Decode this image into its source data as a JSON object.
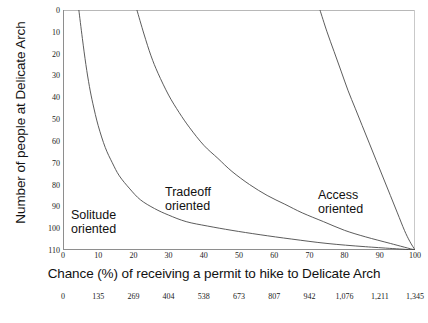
{
  "chart_data": {
    "type": "line",
    "title": "",
    "xlabel": "Chance (%) of receiving a permit to hike to Delicate Arch",
    "ylabel": "Number of people at Delicate Arch",
    "xlim": [
      0,
      100
    ],
    "ylim": [
      0,
      110
    ],
    "y_inverted": true,
    "grid": false,
    "legend_position": "inline-annotations",
    "xticks": [
      "0",
      "10",
      "20",
      "30",
      "40",
      "50",
      "60",
      "70",
      "80",
      "90",
      "100"
    ],
    "xtick_values": [
      0,
      10,
      20,
      30,
      40,
      50,
      60,
      70,
      80,
      90,
      100
    ],
    "yticks": [
      "0",
      "10",
      "20",
      "30",
      "40",
      "50",
      "60",
      "70",
      "80",
      "90",
      "100",
      "110"
    ],
    "ytick_values": [
      0,
      10,
      20,
      30,
      40,
      50,
      60,
      70,
      80,
      90,
      100,
      110
    ],
    "secondary_xaxis": {
      "label": "",
      "ticks": [
        "0",
        "135",
        "269",
        "404",
        "538",
        "673",
        "807",
        "942",
        "1,076",
        "1,211",
        "1,345"
      ],
      "values": [
        0,
        135,
        269,
        404,
        538,
        673,
        807,
        942,
        1076,
        1211,
        1345
      ]
    },
    "series": [
      {
        "name": "Solitude oriented",
        "annotation": "Solitude\noriented",
        "color": "#4a4a4a",
        "x": [
          4.5,
          5.5,
          6.5,
          7.5,
          8.5,
          10,
          12,
          14,
          16,
          19,
          22,
          26,
          30,
          35,
          41,
          48,
          56,
          65,
          75,
          86,
          100
        ],
        "y": [
          0,
          13,
          25,
          35,
          43,
          53,
          63,
          70,
          76,
          82,
          87,
          91,
          94,
          97,
          99,
          101,
          103,
          105,
          107,
          108.5,
          110
        ]
      },
      {
        "name": "Tradeoff oriented",
        "annotation": "Tradeoff\noriented",
        "color": "#4a4a4a",
        "x": [
          21,
          23,
          25,
          27,
          30,
          33,
          36,
          40,
          44,
          48,
          53,
          58,
          63,
          68,
          74,
          80,
          86,
          93,
          100
        ],
        "y": [
          0,
          11,
          21,
          29,
          39,
          47,
          54,
          62,
          68,
          74,
          80,
          85,
          89,
          93,
          97,
          101,
          104,
          107,
          110
        ]
      },
      {
        "name": "Access oriented",
        "annotation": "Access\noriented",
        "color": "#4a4a4a",
        "x": [
          73,
          75,
          77,
          79,
          81,
          83,
          85,
          87,
          89,
          91,
          93,
          95,
          97,
          98.5,
          100
        ],
        "y": [
          0,
          10,
          19,
          28,
          37,
          45,
          53,
          61,
          69,
          77,
          85,
          93,
          101,
          106,
          110
        ]
      }
    ]
  },
  "caption": {
    "clipped_line": ""
  }
}
